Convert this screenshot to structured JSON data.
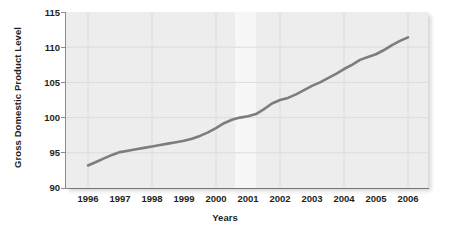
{
  "chart_data": {
    "type": "line",
    "title": "",
    "xlabel": "Years",
    "ylabel": "Gross Domestic Product Level",
    "xlim": [
      1995.3,
      1996.0
    ],
    "ylim": [
      90,
      115
    ],
    "yticks": [
      115,
      110,
      105,
      100,
      95,
      90
    ],
    "xticks": [
      "1996",
      "1997",
      "1998",
      "1999",
      "2000",
      "2001",
      "2002",
      "2003",
      "2004",
      "2005",
      "2006"
    ],
    "grid": true,
    "legend": "none",
    "line_color": "#7d7d7d",
    "panel_color": "#ededed",
    "grid_color": "#dcdcdc",
    "text_color": "#231f20",
    "series": [
      {
        "name": "Gross Domestic Product Level",
        "x": [
          1996.0,
          1996.25,
          1996.5,
          1996.75,
          1997.0,
          1997.25,
          1997.5,
          1997.75,
          1998.0,
          1998.25,
          1998.5,
          1998.75,
          1999.0,
          1999.25,
          1999.5,
          1999.75,
          2000.0,
          2000.25,
          2000.5,
          2000.75,
          2001.0,
          2001.25,
          2001.5,
          2001.75,
          2002.0,
          2002.25,
          2002.5,
          2002.75,
          2003.0,
          2003.25,
          2003.5,
          2003.75,
          2004.0,
          2004.25,
          2004.5,
          2004.75,
          2005.0,
          2005.25,
          2005.5,
          2005.75,
          2006.0
        ],
        "values": [
          93.2,
          93.7,
          94.2,
          94.7,
          95.1,
          95.3,
          95.5,
          95.7,
          95.9,
          96.1,
          96.3,
          96.5,
          96.7,
          97.0,
          97.4,
          97.9,
          98.5,
          99.2,
          99.7,
          100.0,
          100.2,
          100.5,
          101.2,
          102.0,
          102.5,
          102.8,
          103.3,
          103.9,
          104.5,
          105.0,
          105.6,
          106.2,
          106.9,
          107.5,
          108.2,
          108.6,
          109.0,
          109.6,
          110.3,
          110.9,
          111.4
        ]
      }
    ],
    "shaded_bands": [
      {
        "name": "recession-band-2001",
        "x_start": 2000.6,
        "x_end": 2001.25,
        "color": "#f7f7f7"
      }
    ]
  },
  "axis": {
    "y_title": "Gross Domestic Product Level",
    "x_title": "Years"
  }
}
